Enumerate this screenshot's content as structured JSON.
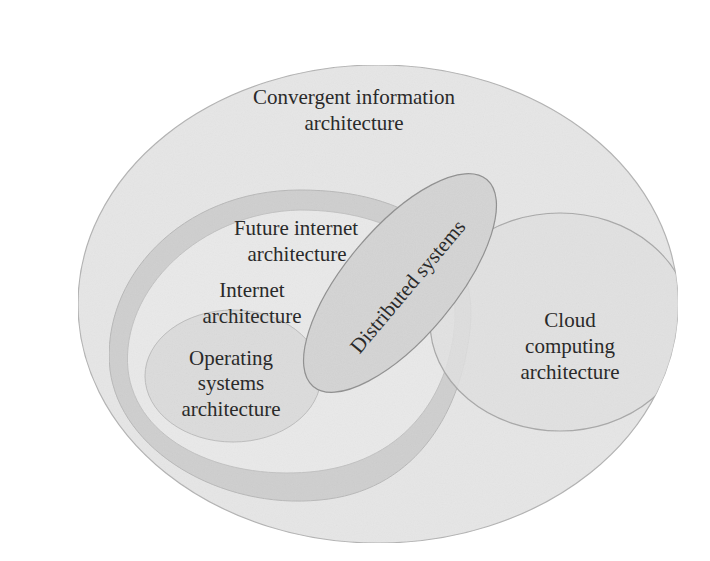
{
  "diagram": {
    "type": "nested-venn",
    "regions": {
      "convergent": {
        "line1": "Convergent information",
        "line2": "architecture"
      },
      "future_internet": {
        "line1": "Future internet",
        "line2": "architecture"
      },
      "internet": {
        "line1": "Internet",
        "line2": "architecture"
      },
      "operating_systems": {
        "line1": "Operating",
        "line2": "systems",
        "line3": "architecture"
      },
      "distributed": {
        "line1": "Distributed systems"
      },
      "cloud": {
        "line1": "Cloud",
        "line2": "computing",
        "line3": "architecture"
      }
    },
    "colors": {
      "background": "#ffffff",
      "convergent_fill": "#e6e6e6",
      "future_internet_fill": "#cfcfcf",
      "internet_fill": "#e9e9e9",
      "operating_fill": "#dcdcdc",
      "distributed_fill": "#d4d4d4",
      "cloud_fill": "#e0e0e0",
      "outline": "#9a9a9a",
      "text": "#2a2a2a"
    }
  }
}
